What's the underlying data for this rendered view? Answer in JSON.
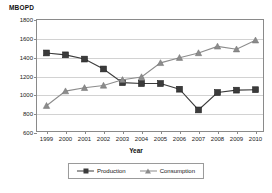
{
  "chart_data": {
    "type": "line",
    "title": "MBOPD",
    "xlabel": "Year",
    "ylabel": "MBOPD",
    "categories": [
      "1999",
      "2000",
      "2001",
      "2002",
      "2003",
      "2004",
      "2005",
      "2006",
      "2007",
      "2008",
      "2009",
      "2010"
    ],
    "ylim": [
      600,
      1800
    ],
    "yticks": [
      600,
      800,
      1000,
      1200,
      1400,
      1600,
      1800
    ],
    "grid": true,
    "legend_position": "bottom",
    "series": [
      {
        "name": "Production",
        "marker": "square",
        "color": "#3b3b3b",
        "values": [
          1450,
          1430,
          1385,
          1280,
          1135,
          1125,
          1125,
          1065,
          845,
          1030,
          1055,
          1060
        ]
      },
      {
        "name": "Consumption",
        "marker": "triangle",
        "color": "#8c8c8c",
        "values": [
          890,
          1045,
          1080,
          1105,
          1165,
          1195,
          1345,
          1400,
          1450,
          1520,
          1490,
          1585
        ]
      }
    ]
  },
  "legend": {
    "production_label": "Production",
    "consumption_label": "Consumption"
  },
  "colors": {
    "production": "#3b3b3b",
    "consumption": "#8c8c8c",
    "grid": "#d2d2d2",
    "axis": "#8a8a8a"
  }
}
